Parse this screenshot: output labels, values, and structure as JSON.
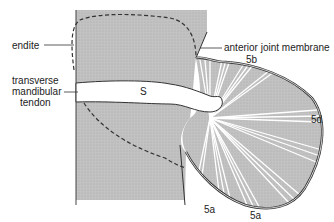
{
  "diagram": {
    "labels": {
      "endite": "endite",
      "tendon_line1": "transverse",
      "tendon_line2": "mandibular",
      "tendon_line3": "tendon",
      "membrane": "anterior joint membrane",
      "s": "S",
      "m5b": "5b",
      "m5d": "5d",
      "m5a_1": "5a",
      "m5a_2": "5a"
    },
    "colors": {
      "stipple": "#bdbdbd",
      "fan_fill": "#c4c4c4",
      "stroke": "#333333",
      "tendon": "#ffffff"
    }
  }
}
